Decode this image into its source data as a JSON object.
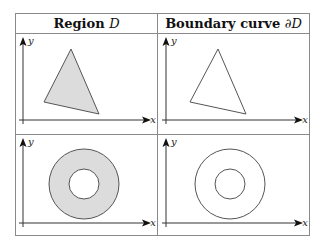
{
  "table": {
    "headers": [
      {
        "text": "Region ",
        "math": "D"
      },
      {
        "text": "Boundary curve ",
        "math": "∂D"
      }
    ],
    "rows": [
      {
        "region": {
          "shape": "filled-triangle",
          "fill": "#dcdcdc",
          "stroke": "#555555"
        },
        "boundary": {
          "shape": "triangle-outline",
          "stroke": "#555555"
        }
      },
      {
        "region": {
          "shape": "filled-annulus",
          "fill": "#dcdcdc",
          "stroke": "#555555"
        },
        "boundary": {
          "shape": "concentric-circles",
          "stroke": "#555555"
        }
      }
    ],
    "axis_labels": {
      "x": "x",
      "y": "y"
    }
  }
}
